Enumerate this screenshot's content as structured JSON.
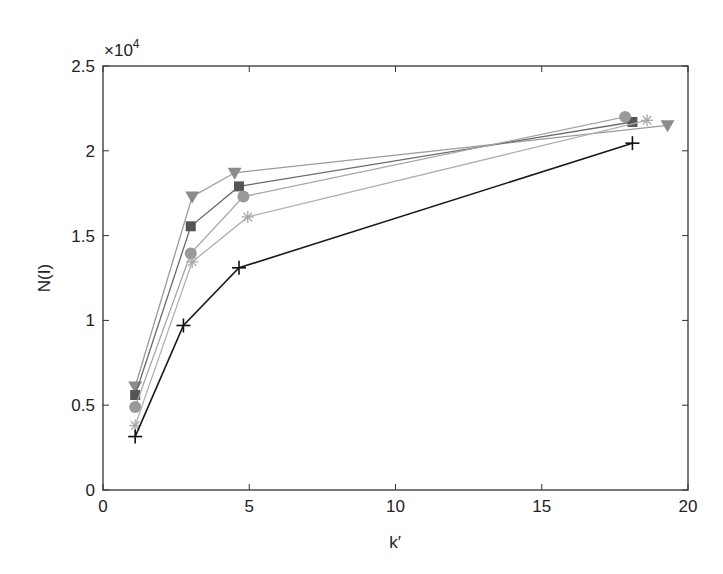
{
  "chart_data": {
    "type": "line",
    "title": "",
    "xlabel": "k′",
    "ylabel": "N(I)",
    "y_multiplier_label": "×10",
    "y_multiplier_exponent": "4",
    "xlim": [
      0,
      20
    ],
    "ylim": [
      0,
      25000
    ],
    "xticks": [
      0,
      5,
      10,
      15,
      20
    ],
    "xtick_labels": [
      "0",
      "5",
      "10",
      "15",
      "20"
    ],
    "yticks": [
      0,
      5000,
      10000,
      15000,
      20000,
      25000
    ],
    "ytick_labels": [
      "0",
      "0.5",
      "1",
      "1.5",
      "2",
      "2.5"
    ],
    "grid": false,
    "legend": null,
    "series": [
      {
        "name": "triangle",
        "marker": "triangle-down",
        "color": "#8c8c8c",
        "line_color": "#9a9a9a",
        "x": [
          1.1,
          3.05,
          4.5,
          19.3
        ],
        "y": [
          6100,
          17300,
          18700,
          21500
        ]
      },
      {
        "name": "square",
        "marker": "square",
        "color": "#555555",
        "line_color": "#6a6a6a",
        "x": [
          1.1,
          3.0,
          4.65,
          18.1
        ],
        "y": [
          5600,
          15550,
          17900,
          21700
        ]
      },
      {
        "name": "circle",
        "marker": "circle",
        "color": "#999999",
        "line_color": "#a5a5a5",
        "x": [
          1.1,
          3.0,
          4.8,
          17.85
        ],
        "y": [
          4900,
          13950,
          17300,
          22000
        ]
      },
      {
        "name": "star",
        "marker": "asterisk",
        "color": "#a8a8a8",
        "line_color": "#b0b0b0",
        "x": [
          1.1,
          3.05,
          4.95,
          18.6
        ],
        "y": [
          3800,
          13450,
          16100,
          21800
        ]
      },
      {
        "name": "plus",
        "marker": "plus",
        "color": "#111111",
        "line_color": "#1a1a1a",
        "x": [
          1.1,
          2.75,
          4.65,
          18.1
        ],
        "y": [
          3150,
          9700,
          13100,
          20450
        ]
      }
    ]
  },
  "layout": {
    "plot_left": 103,
    "plot_right": 688,
    "plot_top": 66,
    "plot_bottom": 490
  }
}
